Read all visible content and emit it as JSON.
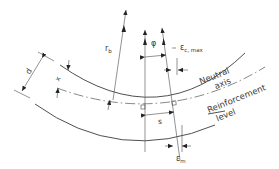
{
  "diagram": {
    "labels": {
      "radius": "r",
      "radius_sub": "b",
      "angle": "φ",
      "strain_c_max": "ε",
      "strain_c_max_sub": "c, max",
      "depth": "d",
      "neutral_depth": "x",
      "crack_spacing": "s",
      "strain_m": "ε",
      "strain_m_sub": "m",
      "neutral_axis_line1": "Neutral",
      "neutral_axis_line2": "axis",
      "reinforcement_line1": "Reinforcement",
      "reinforcement_line2": "level"
    },
    "colors": {
      "line": "#3c3c3c",
      "text": "#3a3a3a",
      "background": "#ffffff"
    }
  }
}
